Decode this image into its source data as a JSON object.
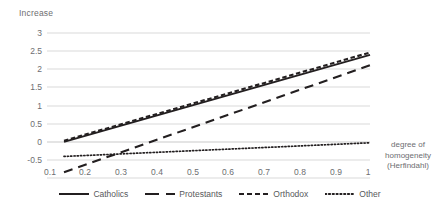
{
  "chart_data": {
    "type": "line",
    "title": "",
    "ylabel": "Increase",
    "xlabel": "degree of homogeneity (Herfindahl)",
    "xlabel_lines": [
      "degree of",
      "homogeneity",
      "(Herfindahl)"
    ],
    "xlim": [
      0.05,
      1.0
    ],
    "ylim": [
      -0.5,
      3
    ],
    "grid": true,
    "legend_position": "bottom",
    "yticks": [
      "3",
      "2.5",
      "2",
      "1.5",
      "1",
      "0.5",
      "0",
      "-0.5"
    ],
    "ytick_values": [
      3,
      2.5,
      2,
      1.5,
      1,
      0.5,
      0,
      -0.5
    ],
    "xticks": [
      "0.1",
      "0.2",
      "0.3",
      "0.4",
      "0.5",
      "0.6",
      "0.7",
      "0.8",
      "0.9",
      "1"
    ],
    "xtick_values": [
      0.1,
      0.2,
      0.3,
      0.4,
      0.5,
      0.6,
      0.7,
      0.8,
      0.9,
      1.0
    ],
    "x": [
      0.1,
      1.0
    ],
    "series": [
      {
        "name": "Catholics",
        "style": "solid",
        "color": "#231f20",
        "values": [
          0.37,
          2.47
        ]
      },
      {
        "name": "Protestants",
        "style": "long-dash",
        "color": "#231f20",
        "values": [
          -0.36,
          2.22
        ]
      },
      {
        "name": "Orthodox",
        "style": "dash",
        "color": "#231f20",
        "values": [
          0.4,
          2.53
        ]
      },
      {
        "name": "Other",
        "style": "dotted",
        "color": "#231f20",
        "values": [
          0.02,
          0.35
        ]
      }
    ]
  },
  "axis": {
    "y_title": "Increase"
  },
  "colors": {
    "gridline": "#d9d9d9",
    "text": "#6d6e71",
    "line": "#231f20",
    "background": "#ffffff"
  }
}
